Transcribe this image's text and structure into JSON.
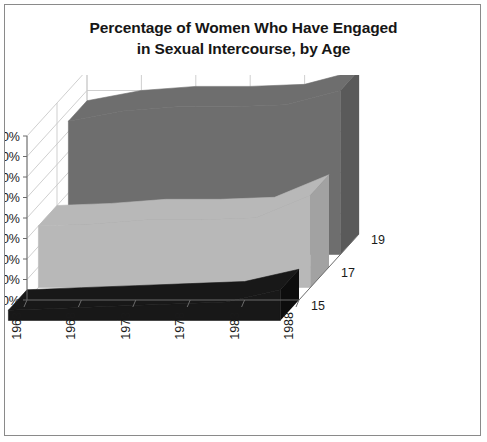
{
  "title": {
    "line1": "Percentage of Women Who Have Engaged",
    "line2": "in Sexual Intercourse, by Age"
  },
  "colors": {
    "age19": "#6e6e6e",
    "age19_side": "#5a5a5a",
    "age17": "#b8b8b8",
    "age17_side": "#a2a2a2",
    "age15": "#181818",
    "age15_side": "#0d0d0d",
    "grid": "#c9c9c9",
    "axis": "#6b6b6b",
    "text": "#1a1a1a",
    "border": "#8a8a8a",
    "background": "#ffffff"
  },
  "axes": {
    "y_ticks": [
      "0%",
      "10%",
      "20%",
      "30%",
      "40%",
      "50%",
      "60%",
      "70%",
      "80%"
    ],
    "x_ticks": [
      "1963",
      "1968",
      "1973",
      "1978",
      "1983",
      "1988"
    ],
    "z_ticks": [
      "15",
      "17",
      "19"
    ],
    "z_ticks_display": [
      "19",
      "17",
      "15"
    ]
  },
  "chart_data": {
    "type": "area",
    "title": "Percentage of Women Who Have Engaged in Sexual Intercourse, by Age",
    "subtitle": "",
    "xlabel": "",
    "ylabel": "",
    "zlabel": "Age",
    "categories": [
      "1963",
      "1968",
      "1973",
      "1978",
      "1983",
      "1988"
    ],
    "x": [
      1963,
      1968,
      1973,
      1978,
      1983,
      1988
    ],
    "ylim": [
      0,
      80
    ],
    "ytick_step": 10,
    "ytick_format": "percent",
    "grid": true,
    "legend": "none",
    "projection": "3d-ribbon",
    "series": [
      {
        "name": "15",
        "age": 15,
        "color": "#181818",
        "depth_index": 0,
        "values": [
          5,
          6,
          7,
          8,
          9,
          15
        ]
      },
      {
        "name": "17",
        "age": 17,
        "color": "#b8b8b8",
        "depth_index": 1,
        "values": [
          30,
          31,
          33,
          33,
          34,
          45
        ]
      },
      {
        "name": "19",
        "age": 19,
        "color": "#6e6e6e",
        "depth_index": 2,
        "values": [
          65,
          70,
          72,
          72,
          73,
          80
        ]
      }
    ]
  }
}
